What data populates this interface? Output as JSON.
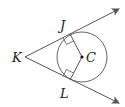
{
  "diagram": {
    "points": {
      "K": {
        "label": "K",
        "x": 25,
        "y": 57
      },
      "J": {
        "label": "J",
        "x": 70,
        "y": 33
      },
      "L": {
        "label": "L",
        "x": 70,
        "y": 81
      },
      "C": {
        "label": "C",
        "x": 82,
        "y": 57
      }
    },
    "circle": {
      "center": "C",
      "radius": 25
    },
    "colors": {
      "stroke": "#555555",
      "text": "#222222"
    }
  }
}
